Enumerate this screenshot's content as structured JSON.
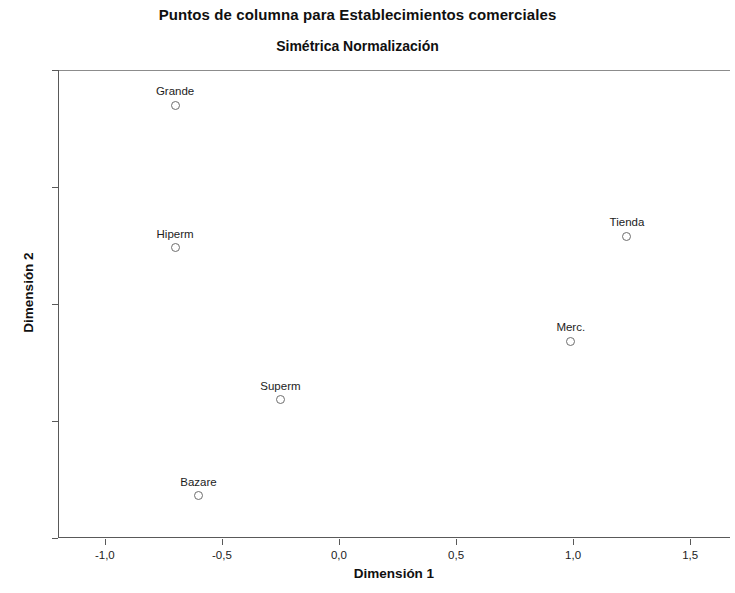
{
  "chart_data": {
    "type": "scatter",
    "title": "Puntos de columna para Establecimientos comerciales",
    "subtitle": "Simétrica Normalización",
    "xlabel": "Dimensión 1",
    "ylabel": "Dimensión 2",
    "xlim": [
      -1.2,
      1.67
    ],
    "ylim": [
      -1.0,
      1.0
    ],
    "grid": false,
    "legend": null,
    "xticks": [
      -1.0,
      -0.5,
      0.0,
      0.5,
      1.0,
      1.5
    ],
    "xticklabels": [
      "-1,0",
      "-0,5",
      "0,0",
      "0,5",
      "1,0",
      "1,5"
    ],
    "yticks": [
      1.0,
      0.5,
      0.0,
      -0.5,
      -1.0
    ],
    "yticklabels": [
      "1,0",
      "0,5",
      "0,0",
      "-0,5",
      "-1,0"
    ],
    "marker": "open-circle",
    "marker_color": "#6e6e6e",
    "points": [
      {
        "label": "Grande",
        "x": -0.7,
        "y": 0.85
      },
      {
        "label": "Hiperm",
        "x": -0.7,
        "y": 0.24
      },
      {
        "label": "Tienda",
        "x": 1.23,
        "y": 0.29
      },
      {
        "label": "Merc.",
        "x": 0.99,
        "y": -0.16
      },
      {
        "label": "Superm",
        "x": -0.25,
        "y": -0.41
      },
      {
        "label": "Bazare",
        "x": -0.6,
        "y": -0.82
      }
    ]
  },
  "colors": {
    "axis": "#595959",
    "frame_top": "#8c8c8c",
    "text": "#1c1c1c",
    "background": "#ffffff"
  }
}
